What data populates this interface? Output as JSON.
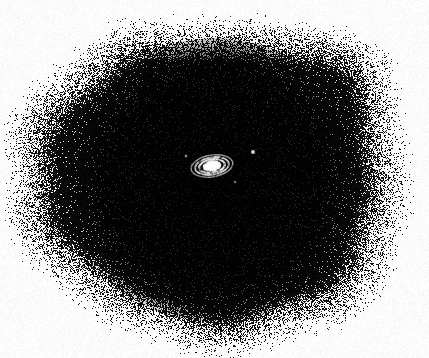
{
  "image": {
    "kind": "astronomical-photographic-plate",
    "title": "Ringed spiral galaxy on halftone plate",
    "medium": "halftone / dithered monochrome print scan",
    "width_px": 429,
    "height_px": 358,
    "background_color": "#ffffff",
    "ink_color": "#000000",
    "object_color": "#ffffff"
  },
  "halo": {
    "name": "dithered dark field",
    "description": "Large stippled black blob filling most of the frame, fading to white at the edges",
    "center_x": 215,
    "center_y": 180,
    "radius_x": 200,
    "radius_y": 168,
    "solid_core_radius_x": 152,
    "solid_core_radius_y": 142,
    "bounds": {
      "left": 15,
      "top": 12,
      "right": 415,
      "bottom": 348
    },
    "edge_texture": "random stipple / dither",
    "core_color": "#070707"
  },
  "galaxy": {
    "name": "ringed spiral galaxy",
    "center_x": 212,
    "center_y": 166,
    "width_px": 42,
    "height_px": 25,
    "tilt_degrees": -9,
    "core_color": "#ffffff",
    "ring_color": "#f2f2f2",
    "rings": [
      {
        "label": "inner disk",
        "rx": 8,
        "ry": 4.2,
        "thickness": 3.0,
        "opacity": 1.0
      },
      {
        "label": "inner ring",
        "rx": 13,
        "ry": 6.6,
        "thickness": 2.2,
        "opacity": 0.95
      },
      {
        "label": "middle ring",
        "rx": 17,
        "ry": 8.6,
        "thickness": 1.9,
        "opacity": 0.85
      },
      {
        "label": "outer ring",
        "rx": 21,
        "ry": 10.8,
        "thickness": 1.5,
        "opacity": 0.62
      }
    ]
  },
  "stars": [
    {
      "name": "faint star",
      "x": 253,
      "y": 152,
      "size": 2.0,
      "opacity": 0.8
    },
    {
      "name": "faint star",
      "x": 186,
      "y": 156,
      "size": 1.4,
      "opacity": 0.5
    },
    {
      "name": "faint star",
      "x": 235,
      "y": 182,
      "size": 1.2,
      "opacity": 0.45
    }
  ]
}
